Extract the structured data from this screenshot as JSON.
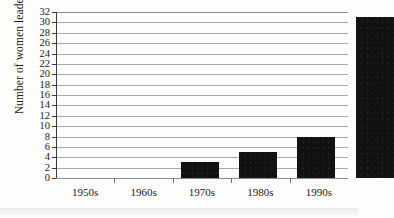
{
  "chart_data": {
    "type": "bar",
    "title": "",
    "subtitle": "",
    "xlabel": "",
    "ylabel": "Number of women leaders",
    "categories": [
      "1950s",
      "1960s",
      "1970s",
      "1980s",
      "1990s"
    ],
    "values": [
      0,
      3,
      5,
      8,
      31
    ],
    "ylim": [
      0,
      32
    ],
    "ytick_step": 2,
    "yticks": [
      0,
      2,
      4,
      6,
      8,
      10,
      12,
      14,
      16,
      18,
      20,
      22,
      24,
      26,
      28,
      30,
      32
    ],
    "ytick_labels": [
      "0",
      "2",
      "4",
      "6",
      "8",
      "10",
      "12",
      "14",
      "16",
      "18",
      "20",
      "22",
      "24",
      "26",
      "28",
      "30",
      "32"
    ],
    "grid": true,
    "grid_orientation": "horizontal",
    "legend": false,
    "legend_position": "none",
    "series": [
      {
        "name": "Number of women leaders",
        "values": [
          0,
          3,
          5,
          8,
          31
        ]
      }
    ],
    "annotations": [],
    "colors": {
      "bar_fill": "#111111",
      "grid_line": "#a9a9a9",
      "axis_line": "#3a3a3a",
      "text": "#1a1a1a",
      "background": "#fdfdfb"
    }
  }
}
